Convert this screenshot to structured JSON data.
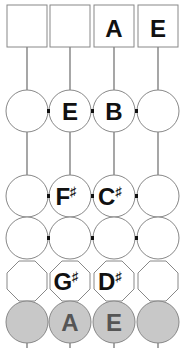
{
  "diagram": {
    "title_boxes": [
      "",
      "",
      "A",
      "E"
    ],
    "rows": [
      {
        "shape": "circle",
        "fill": "#ffffff",
        "notes": [
          "",
          "E",
          "B",
          ""
        ]
      },
      {
        "shape": "circle",
        "fill": "#ffffff",
        "notes": [
          "",
          "F♯",
          "C♯",
          ""
        ]
      },
      {
        "shape": "circle",
        "fill": "#ffffff",
        "notes": [
          "",
          "",
          "",
          ""
        ]
      },
      {
        "shape": "octagon",
        "fill": "#ffffff",
        "notes": [
          "",
          "G♯",
          "D♯",
          ""
        ]
      },
      {
        "shape": "circle",
        "fill": "#c8c8c8",
        "notes": [
          "",
          "A",
          "E",
          ""
        ]
      }
    ],
    "colors": {
      "stroke": "#888888",
      "grey_fill": "#c8c8c8",
      "text": "#111111",
      "grey_text": "#555555"
    }
  },
  "labels": {
    "box_1": "",
    "box_2": "",
    "box_3": "A",
    "box_4": "E",
    "r1_c2": "E",
    "r1_c3": "B",
    "r2_c2_letter": "F",
    "r2_c2_acc": "♯",
    "r2_c3_letter": "C",
    "r2_c3_acc": "♯",
    "r4_c2_letter": "G",
    "r4_c2_acc": "♯",
    "r4_c3_letter": "D",
    "r4_c3_acc": "♯",
    "r5_c2": "A",
    "r5_c3": "E"
  }
}
